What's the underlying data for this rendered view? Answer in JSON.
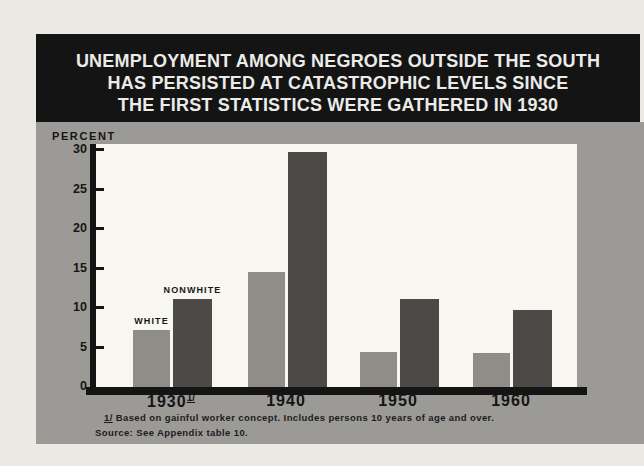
{
  "window": {
    "width": 644,
    "height": 466
  },
  "colors": {
    "page_bg": "#ebe9e4",
    "banner_bg": "#141414",
    "title_text": "#ebebe8",
    "panel_bg": "#9b9a97",
    "plot_bg": "#f7f6f1",
    "axis": "#141414"
  },
  "title": {
    "lines": [
      "UNEMPLOYMENT AMONG NEGROES OUTSIDE THE SOUTH",
      "HAS PERSISTED AT CATASTROPHIC LEVELS SINCE",
      "THE FIRST STATISTICS WERE GATHERED IN 1930"
    ]
  },
  "chart_data": {
    "type": "bar",
    "title": "UNEMPLOYMENT AMONG NEGROES OUTSIDE THE SOUTH HAS PERSISTED AT CATASTROPHIC LEVELS SINCE THE FIRST STATISTICS WERE GATHERED IN 1930",
    "ylabel": "PERCENT",
    "ylim": [
      0,
      30
    ],
    "yticks": [
      0,
      5,
      10,
      15,
      20,
      25,
      30
    ],
    "grid": false,
    "legend_position": "labels-above-first-group-bars",
    "categories": [
      "1930",
      "1940",
      "1950",
      "1960"
    ],
    "category_footnote": {
      "index": 0,
      "marker": "1/"
    },
    "series": [
      {
        "name": "WHITE",
        "color": "#8e8d88",
        "values": [
          7.2,
          14.6,
          4.4,
          4.3
        ]
      },
      {
        "name": "NONWHITE",
        "color": "#4b4a46",
        "values": [
          11.2,
          29.7,
          11.2,
          9.7
        ]
      }
    ],
    "footnote_marker": "1/",
    "footnote_text": "Based on gainful worker concept.  Includes persons 10 years of age and over.",
    "source": "Source: See Appendix table 10."
  }
}
